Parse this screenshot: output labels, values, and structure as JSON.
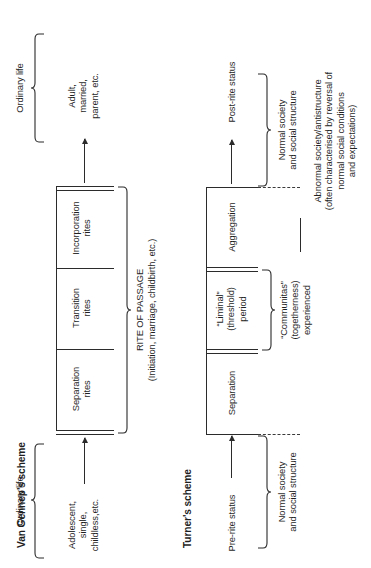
{
  "figure": {
    "title_left": "Van Gennep's scheme",
    "title_right": "Turner's scheme",
    "rite_label_line1": "RITE OF PASSAGE",
    "rite_label_line2": "(Initiation, marriage, childbirth, etc.)"
  },
  "van_gennep": {
    "start_state": "Adolescent,\nsingle,\nchildless,etc.",
    "end_state": "Adult,\nmarried,\nparent, etc.",
    "phases": [
      {
        "label": "Separation\nrites"
      },
      {
        "label": "Transition\nrites"
      },
      {
        "label": "Incorporation\nrites"
      }
    ],
    "bracket_start_label": "Ordinary life",
    "bracket_end_label": "Ordinary life"
  },
  "turner": {
    "start_state": "Pre-rite status",
    "end_state": "Post-rite status",
    "phases": [
      {
        "label": "Separation"
      },
      {
        "label": "“Liminal”\n(threshold)\nperiod"
      },
      {
        "label": "Aggregation"
      }
    ],
    "communitas_label": "“Communitas”\n(togetherness)\nexperienced",
    "normal_society_start": "Normal society\nand social structure",
    "normal_society_end": "Normal society\nand social structure",
    "antistructure_label": "Abnormal society/antistructure\n(often characterised by reversal of\nnormal social conditions\nand expectations)"
  },
  "colors": {
    "ink": "#1f1f1f",
    "rule": "#2b2b2b",
    "background": "#ffffff"
  }
}
